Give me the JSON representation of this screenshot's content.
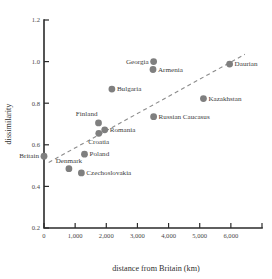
{
  "chart_data": {
    "type": "scatter",
    "title": "",
    "xlabel": "distance from Britain (km)",
    "ylabel": "dissimilarity",
    "xlim": [
      0,
      7000
    ],
    "ylim": [
      0.2,
      1.2
    ],
    "grid": false,
    "legend": "none",
    "xticks": [
      0,
      1000,
      2000,
      3000,
      4000,
      5000,
      6000,
      7000
    ],
    "xticklabels": [
      "0",
      "1,000",
      "2,000",
      "3,000",
      "4,000",
      "5,000",
      "6,000",
      ""
    ],
    "yticks": [
      0.2,
      0.4,
      0.6,
      0.8,
      1.0,
      1.2
    ],
    "yticklabels": [
      "0.2",
      "0.4",
      "0.6",
      "0.8",
      "1.0",
      "1.2"
    ],
    "marker_color": "#7f7f7f",
    "points": [
      {
        "label": "Britain",
        "x": 0,
        "y": 0.545,
        "label_pos": "left"
      },
      {
        "label": "Denmark",
        "x": 800,
        "y": 0.485,
        "label_pos": "above"
      },
      {
        "label": "Czechoslovakia",
        "x": 1200,
        "y": 0.465,
        "label_pos": "right"
      },
      {
        "label": "Poland",
        "x": 1300,
        "y": 0.555,
        "label_pos": "right"
      },
      {
        "label": "Finland",
        "x": 1750,
        "y": 0.705,
        "label_pos": "above-left"
      },
      {
        "label": "Croatia",
        "x": 1760,
        "y": 0.655,
        "label_pos": "below"
      },
      {
        "label": "Romania",
        "x": 1950,
        "y": 0.672,
        "label_pos": "right"
      },
      {
        "label": "Bulgaria",
        "x": 2180,
        "y": 0.868,
        "label_pos": "right"
      },
      {
        "label": "Georgia",
        "x": 3520,
        "y": 1.0,
        "label_pos": "left"
      },
      {
        "label": "Armenia",
        "x": 3500,
        "y": 0.962,
        "label_pos": "right"
      },
      {
        "label": "Russian Caucasus",
        "x": 3520,
        "y": 0.735,
        "label_pos": "right"
      },
      {
        "label": "Kazakhstan",
        "x": 5120,
        "y": 0.822,
        "label_pos": "right"
      },
      {
        "label": "Daurian",
        "x": 5960,
        "y": 0.988,
        "label_pos": "right"
      }
    ],
    "trend_line": {
      "style": "dashed",
      "color": "#8c8c8c",
      "x_start": 150,
      "y_start": 0.515,
      "x_end": 6450,
      "y_end": 1.035
    }
  }
}
